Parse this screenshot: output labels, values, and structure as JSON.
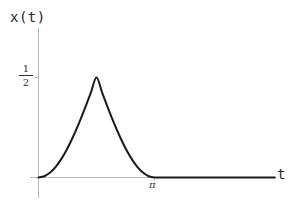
{
  "figure": {
    "background_color": "#ffffff",
    "width": 298,
    "height": 204
  },
  "axes": {
    "y_axis_name": "x(t)",
    "x_axis_name": "t",
    "axis_color": "#b8b8b8",
    "curve_color": "#1a1a1a",
    "y_tick_label": {
      "numerator": "1",
      "denominator": "2"
    },
    "x_tick_label": "π"
  },
  "chart_data": {
    "type": "line",
    "title": "",
    "xlabel": "t",
    "ylabel": "x(t)",
    "grid": false,
    "legend": null,
    "xlim": [
      0,
      6.4
    ],
    "ylim": [
      0,
      0.62
    ],
    "xticks": [
      3.14159
    ],
    "xticklabels": [
      "π"
    ],
    "yticks": [
      0.5
    ],
    "yticklabels": [
      "1/2"
    ],
    "annotations": [],
    "series": [
      {
        "name": "x(t)",
        "description": "Raised-cosine pulse: x(t) = (1/2)(1 - cos t) scaled to peak 1/2 on 0 <= t <= pi, and 0 for t > pi",
        "x": [
          0.0,
          0.1571,
          0.3142,
          0.4712,
          0.6283,
          0.7854,
          0.9425,
          1.0996,
          1.2566,
          1.4137,
          1.5708,
          1.7279,
          1.885,
          2.042,
          2.1991,
          2.3562,
          2.5133,
          2.6704,
          2.8274,
          2.9845,
          3.1416,
          3.4,
          3.8,
          4.2,
          4.6,
          5.0,
          5.4,
          5.8,
          6.2,
          6.4
        ],
        "y": [
          0.0,
          0.0061,
          0.0245,
          0.0545,
          0.0955,
          0.1464,
          0.2061,
          0.273,
          0.3455,
          0.422,
          0.5,
          0.422,
          0.3455,
          0.273,
          0.2061,
          0.1464,
          0.0955,
          0.0545,
          0.0245,
          0.0061,
          0.0,
          0.0,
          0.0,
          0.0,
          0.0,
          0.0,
          0.0,
          0.0,
          0.0,
          0.0
        ]
      }
    ]
  }
}
